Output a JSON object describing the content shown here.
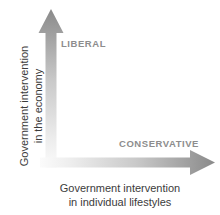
{
  "diagram": {
    "type": "two-axis-conceptual-diagram",
    "background_color": "#ffffff",
    "axes": {
      "vertical": {
        "direction": "up",
        "title_line1": "Government intervention",
        "title_line2": "in the economy",
        "pole_label": "LIBERAL",
        "gradient_from_origin": "#f2f2f2",
        "gradient_to_tip": "#8a8a8a"
      },
      "horizontal": {
        "direction": "right",
        "title_line1": "Government intervention",
        "title_line2": "in individual lifestyles",
        "pole_label": "CONSERVATIVE",
        "gradient_from_origin": "#f2f2f2",
        "gradient_to_tip": "#8a8a8a"
      }
    },
    "colors": {
      "pole_label_text": "#8d8d8d",
      "axis_title_text": "#3b3b3b",
      "arrow_dark": "#8a8a8a",
      "arrow_light": "#f4f4f4"
    }
  }
}
